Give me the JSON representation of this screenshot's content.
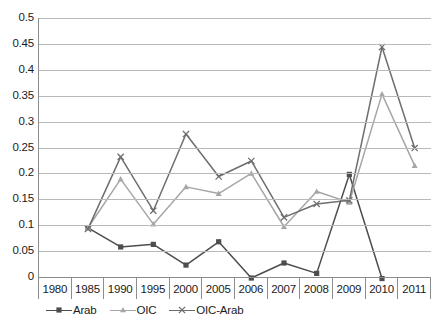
{
  "chart_data": {
    "type": "line",
    "title": "",
    "subtitle": "",
    "xlabel": "",
    "ylabel": "",
    "categories": [
      "1980",
      "1985",
      "1990",
      "1995",
      "2000",
      "2005",
      "2006",
      "2007",
      "2008",
      "2009",
      "2010",
      "2011"
    ],
    "ylim": [
      0,
      0.5
    ],
    "ytick_labels": [
      "0",
      "0.05",
      "0.1",
      "0.15",
      "0.2",
      "0.25",
      "0.3",
      "0.35",
      "0.4",
      "0.45",
      "0.5"
    ],
    "ytick_values": [
      0,
      0.05,
      0.1,
      0.15,
      0.2,
      0.25,
      0.3,
      0.35,
      0.4,
      0.45,
      0.5
    ],
    "grid": true,
    "legend_position": "bottom-left",
    "series": [
      {
        "name": "Arab",
        "color": "#4d4d4d",
        "marker": "square",
        "values": [
          null,
          0.095,
          0.058,
          0.063,
          0.023,
          0.068,
          -0.002,
          0.027,
          0.007,
          0.198,
          -0.003,
          null
        ]
      },
      {
        "name": "OIC",
        "color": "#a6a6a6",
        "marker": "triangle",
        "values": [
          null,
          0.095,
          0.189,
          0.102,
          0.174,
          0.161,
          0.2,
          0.097,
          0.165,
          0.144,
          0.353,
          0.215
        ]
      },
      {
        "name": "OIC-Arab",
        "color": "#6e6e6e",
        "marker": "cross",
        "values": [
          null,
          0.093,
          0.232,
          0.128,
          0.276,
          0.194,
          0.224,
          0.115,
          0.141,
          0.148,
          0.444,
          0.249
        ]
      }
    ]
  },
  "legend": {
    "items": [
      {
        "label": "Arab"
      },
      {
        "label": "OIC"
      },
      {
        "label": "OIC-Arab"
      }
    ]
  },
  "axis_colors": {
    "gridline": "#b9b9b9",
    "axis": "#8d8d8d",
    "text": "#1b1b1b"
  }
}
